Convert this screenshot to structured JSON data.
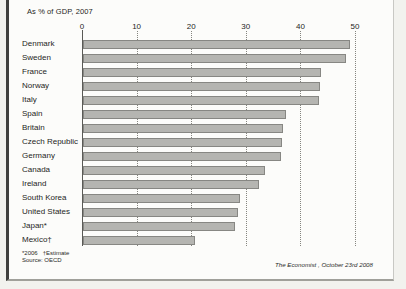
{
  "title": "As % of GDP, 2007",
  "chart_data": {
    "type": "bar",
    "orientation": "horizontal",
    "title": "As % of GDP, 2007",
    "categories": [
      "Denmark",
      "Sweden",
      "France",
      "Norway",
      "Italy",
      "Spain",
      "Britain",
      "Czech Republic",
      "Germany",
      "Canada",
      "Ireland",
      "South Korea",
      "United States",
      "Japan*",
      "Mexico†"
    ],
    "values": [
      48.9,
      48.2,
      43.6,
      43.4,
      43.3,
      37.2,
      36.6,
      36.4,
      36.2,
      33.3,
      32.2,
      28.7,
      28.4,
      27.9,
      20.5
    ],
    "xlabel": "",
    "ylabel": "",
    "xlim": [
      0,
      50
    ],
    "xticks": [
      0,
      10,
      20,
      30,
      40,
      50
    ],
    "grid": "vertical-dotted",
    "legend": "none",
    "bar_color": "#b5b5b1"
  },
  "footnotes": {
    "note": "*2006   †Estimate",
    "source": "Source: OECD"
  },
  "credit": "The Economist , October 23rd 2008"
}
